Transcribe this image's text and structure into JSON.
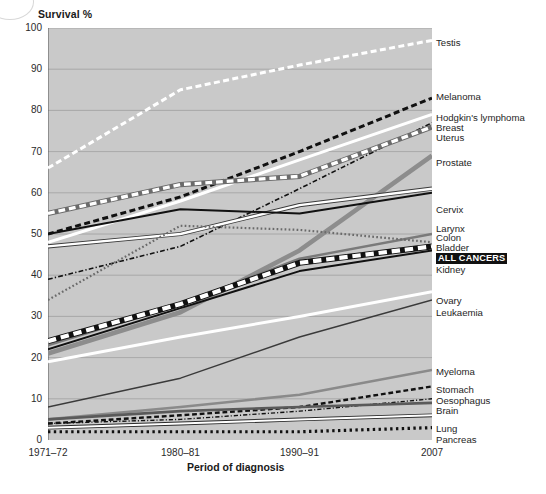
{
  "chart_data": {
    "type": "line",
    "title": "",
    "ylabel": "Survival %",
    "xlabel": "Period of diagnosis",
    "ylim": [
      0,
      100
    ],
    "yticks": [
      0,
      10,
      20,
      30,
      40,
      50,
      60,
      70,
      80,
      90,
      100
    ],
    "grid": true,
    "legend_position": "right-of-axes (direct line labels)",
    "x": [
      "1971-72",
      "1980-81",
      "1990-91",
      "2007"
    ],
    "xticks": [
      "1971–72",
      "1980–81",
      "1990–91",
      "2007"
    ],
    "plot_background": "#c9c9c9",
    "series": [
      {
        "name": "Testis",
        "values": [
          66,
          85,
          91,
          97
        ],
        "style": "dashed",
        "color": "#ffffff",
        "width": 3.0
      },
      {
        "name": "Melanoma",
        "values": [
          50,
          59,
          70,
          83
        ],
        "style": "dashed",
        "color": "#111111",
        "width": 3.0
      },
      {
        "name": "Hodgkin's lymphoma",
        "values": [
          48,
          58,
          68,
          79
        ],
        "style": "solid",
        "color": "#ffffff",
        "width": 3.0
      },
      {
        "name": "Breast",
        "values": [
          39,
          47,
          61,
          77
        ],
        "style": "dashdot",
        "color": "#111111",
        "width": 1.6
      },
      {
        "name": "Uterus",
        "values": [
          55,
          62,
          64,
          76
        ],
        "style": "dashed",
        "color": "#ffffff",
        "width": 3.4,
        "outline": "#6b6b6b"
      },
      {
        "name": "Prostate",
        "values": [
          21,
          31,
          46,
          69
        ],
        "style": "solid",
        "color": "#8d8d8d",
        "width": 4.6
      },
      {
        "name": "Cervix",
        "values": [
          47,
          50,
          57,
          61
        ],
        "style": "solid",
        "color": "#ffffff",
        "width": 2.4,
        "outline": "#3a3a3a"
      },
      {
        "name": "Larynx",
        "values": [
          50,
          56,
          55,
          60
        ],
        "style": "solid",
        "color": "#111111",
        "width": 2.0
      },
      {
        "name": "Colon",
        "values": [
          23,
          33,
          44,
          50
        ],
        "style": "solid",
        "color": "#7a7a7a",
        "width": 2.4
      },
      {
        "name": "Bladder",
        "values": [
          34,
          52,
          51,
          48
        ],
        "style": "dotted",
        "color": "#6a6a6a",
        "width": 2.2
      },
      {
        "name": "ALL CANCERS",
        "values": [
          24,
          33,
          43,
          47
        ],
        "style": "dashed",
        "color": "#ffffff",
        "width": 4.2,
        "outline": "#111111"
      },
      {
        "name": "Kidney",
        "values": [
          22,
          32,
          41,
          46
        ],
        "style": "solid",
        "color": "#111111",
        "width": 2.0
      },
      {
        "name": "Ovary",
        "values": [
          19,
          25,
          30,
          36
        ],
        "style": "solid",
        "color": "#ffffff",
        "width": 3.0
      },
      {
        "name": "Leukaemia",
        "values": [
          8,
          15,
          25,
          34
        ],
        "style": "solid",
        "color": "#3a3a3a",
        "width": 1.4
      },
      {
        "name": "Myeloma",
        "values": [
          5,
          8,
          11,
          17
        ],
        "style": "solid",
        "color": "#8a8a8a",
        "width": 2.6
      },
      {
        "name": "Stomach",
        "values": [
          4,
          6,
          8,
          13
        ],
        "style": "dashed",
        "color": "#111111",
        "width": 2.4
      },
      {
        "name": "Oesophagus",
        "values": [
          4,
          5,
          7,
          10
        ],
        "style": "dashdot",
        "color": "#111111",
        "width": 1.4
      },
      {
        "name": "Brain",
        "values": [
          5,
          7,
          8,
          9
        ],
        "style": "solid",
        "color": "#5a5a5a",
        "width": 2.6
      },
      {
        "name": "Lung",
        "values": [
          3,
          4,
          5,
          6
        ],
        "style": "solid",
        "color": "#ffffff",
        "width": 2.0,
        "outline": "#2a2a2a"
      },
      {
        "name": "Pancreas",
        "values": [
          2,
          2,
          2,
          3
        ],
        "style": "dotted",
        "color": "#111111",
        "width": 3.2
      }
    ]
  },
  "axis": {
    "ylabel": "Survival %",
    "xlabel": "Period of diagnosis",
    "yticks": [
      "100",
      "90",
      "80",
      "70",
      "60",
      "50",
      "40",
      "30",
      "20",
      "10",
      "0"
    ],
    "xticks": [
      "1971–72",
      "1980–81",
      "1990–91",
      "2007"
    ]
  },
  "series_labels": [
    {
      "text": "Testis",
      "top": 38,
      "highlight": false
    },
    {
      "text": "Melanoma",
      "top": 92,
      "highlight": false
    },
    {
      "text": "Hodgkin's lymphoma",
      "top": 113,
      "highlight": false
    },
    {
      "text": "Breast",
      "top": 123,
      "highlight": false
    },
    {
      "text": "Uterus",
      "top": 133,
      "highlight": false
    },
    {
      "text": "Prostate",
      "top": 158,
      "highlight": false
    },
    {
      "text": "Cervix",
      "top": 205,
      "highlight": false
    },
    {
      "text": "Larynx",
      "top": 224,
      "highlight": false
    },
    {
      "text": "Colon",
      "top": 233,
      "highlight": false
    },
    {
      "text": "Bladder",
      "top": 243,
      "highlight": false
    },
    {
      "text": "ALL CANCERS",
      "top": 253,
      "highlight": true
    },
    {
      "text": "Kidney",
      "top": 265,
      "highlight": false
    },
    {
      "text": "Ovary",
      "top": 296,
      "highlight": false
    },
    {
      "text": "Leukaemia",
      "top": 308,
      "highlight": false
    },
    {
      "text": "Myeloma",
      "top": 367,
      "highlight": false
    },
    {
      "text": "Stomach",
      "top": 385,
      "highlight": false
    },
    {
      "text": "Oesophagus",
      "top": 396,
      "highlight": false
    },
    {
      "text": "Brain",
      "top": 406,
      "highlight": false
    },
    {
      "text": "Lung",
      "top": 424,
      "highlight": false
    },
    {
      "text": "Pancreas",
      "top": 435,
      "highlight": false
    }
  ],
  "caption": ""
}
